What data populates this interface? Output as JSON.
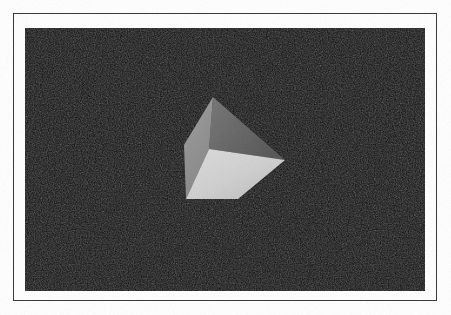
{
  "figure": {
    "kind": "raster-render",
    "caption": "",
    "background_color": "#0c0c0c",
    "frame_color": "#3a3a3a",
    "matte_color": "#ffffff",
    "page_color": "#ffffff",
    "plate": {
      "x": 13,
      "y": 13,
      "width": 424,
      "height": 288
    },
    "canvas": {
      "x": 25,
      "y": 28,
      "width": 400,
      "height": 263
    }
  },
  "scene": {
    "name": "shaded-cube",
    "object": "cube",
    "shading": "flat-faceted",
    "visible_faces": 3,
    "faces": [
      {
        "name": "top-right-face",
        "label": "top",
        "color": "#6a6a6a",
        "brightness": 0.42,
        "points": "213,97 285,160 209,149"
      },
      {
        "name": "left-face",
        "label": "left",
        "color": "#949494",
        "brightness": 0.58,
        "points": "213,97 209,149 186,199 184,145"
      },
      {
        "name": "front-bottom-face",
        "label": "front",
        "color": "#d2d2d2",
        "brightness": 0.82,
        "points": "209,149 285,160 238,199 186,199"
      }
    ],
    "vertices": [
      {
        "name": "top",
        "x": 213,
        "y": 97
      },
      {
        "name": "left-upper",
        "x": 184,
        "y": 145
      },
      {
        "name": "center",
        "x": 209,
        "y": 149
      },
      {
        "name": "right",
        "x": 285,
        "y": 160
      },
      {
        "name": "bottom-left",
        "x": 186,
        "y": 199
      },
      {
        "name": "bottom",
        "x": 238,
        "y": 199
      }
    ],
    "light": {
      "description": "single key light, upper-front-left",
      "ambient": 0.08
    }
  }
}
